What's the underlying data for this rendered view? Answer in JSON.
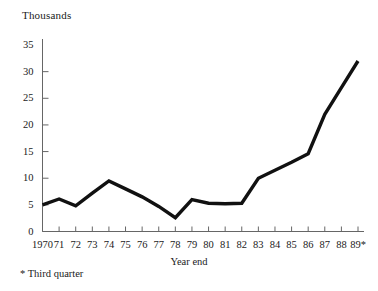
{
  "chart_data": {
    "type": "line",
    "title": "",
    "subtitle": "",
    "unit_label": "Thousands",
    "xlabel": "Year end",
    "ylabel": "",
    "footnote": "* Third quarter",
    "grid": false,
    "legend": "none",
    "ylim": [
      0,
      35
    ],
    "yticks": [
      0,
      5,
      10,
      15,
      20,
      25,
      30,
      35
    ],
    "ytick_labels": [
      "0",
      "5",
      "10",
      "15",
      "20",
      "25",
      "30",
      "35"
    ],
    "categories": [
      "1970",
      "71",
      "72",
      "73",
      "74",
      "75",
      "76",
      "77",
      "78",
      "79",
      "80",
      "81",
      "82",
      "83",
      "84",
      "85",
      "86",
      "87",
      "88",
      "89*"
    ],
    "x": [
      1970,
      1971,
      1972,
      1973,
      1974,
      1975,
      1976,
      1977,
      1978,
      1979,
      1980,
      1981,
      1982,
      1983,
      1984,
      1985,
      1986,
      1987,
      1988,
      1989
    ],
    "values": [
      5.0,
      6.1,
      4.8,
      7.2,
      9.5,
      8.0,
      6.5,
      4.7,
      2.6,
      6.0,
      5.3,
      5.2,
      5.3,
      10.0,
      11.5,
      13.0,
      14.6,
      22.0,
      27.0,
      32.0
    ],
    "series": [
      {
        "name": "value",
        "color": "#111111",
        "values": [
          5.0,
          6.1,
          4.8,
          7.2,
          9.5,
          8.0,
          6.5,
          4.7,
          2.6,
          6.0,
          5.3,
          5.2,
          5.3,
          10.0,
          11.5,
          13.0,
          14.6,
          22.0,
          27.0,
          32.0
        ]
      }
    ]
  },
  "colors": {
    "line": "#111111",
    "axis": "#666666",
    "text": "#1a1a1a",
    "background": "#ffffff"
  }
}
